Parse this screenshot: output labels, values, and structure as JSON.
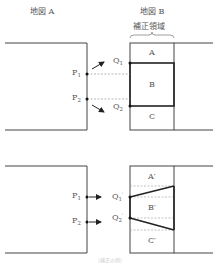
{
  "headers": {
    "map_a": "地図 A",
    "map_b": "地図 B",
    "correction_region": "補正領域"
  },
  "top_diagram": {
    "points_left": [
      {
        "base": "P",
        "sub": "1"
      },
      {
        "base": "P",
        "sub": "2"
      }
    ],
    "points_right": [
      {
        "base": "Q",
        "sub": "1"
      },
      {
        "base": "Q",
        "sub": "2"
      }
    ],
    "regions": [
      "A",
      "B",
      "C"
    ]
  },
  "bottom_diagram": {
    "points_left": [
      {
        "base": "P",
        "sub": "1"
      },
      {
        "base": "P",
        "sub": "2"
      }
    ],
    "points_right": [
      {
        "base": "Q",
        "sub": "1",
        "prime": "′"
      },
      {
        "base": "Q",
        "sub": "2",
        "prime": "′"
      }
    ],
    "regions": [
      "A′",
      "B′",
      "C′"
    ]
  },
  "caption": "（補正の例）"
}
